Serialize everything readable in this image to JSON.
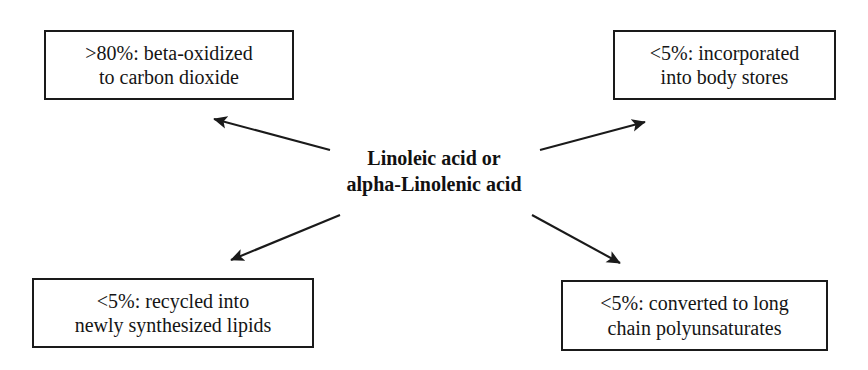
{
  "diagram": {
    "center": {
      "label": "Linoleic acid or\nalpha-Linolenic acid"
    },
    "nodes": {
      "top_left": {
        "label": ">80%: beta-oxidized\nto carbon dioxide",
        "percent": ">80%",
        "fate": "beta-oxidized to carbon dioxide"
      },
      "top_right": {
        "label": "<5%: incorporated\ninto body stores",
        "percent": "<5%",
        "fate": "incorporated into body stores"
      },
      "bottom_left": {
        "label": "<5%: recycled into\nnewly synthesized lipids",
        "percent": "<5%",
        "fate": "recycled into newly synthesized lipids"
      },
      "bottom_right": {
        "label": "<5%: converted to long\nchain polyunsaturates",
        "percent": "<5%",
        "fate": "converted to long chain polyunsaturates"
      }
    },
    "colors": {
      "background": "#ffffff",
      "border": "#1a1a1a",
      "text": "#151515",
      "arrow": "#1a1a1a"
    },
    "arrows": [
      {
        "name": "arrow-to-top-left",
        "from": [
          330,
          150
        ],
        "to": [
          211,
          117
        ]
      },
      {
        "name": "arrow-to-top-right",
        "from": [
          540,
          150
        ],
        "to": [
          648,
          120
        ]
      },
      {
        "name": "arrow-to-bottom-left",
        "from": [
          340,
          215
        ],
        "to": [
          228,
          262
        ]
      },
      {
        "name": "arrow-to-bottom-right",
        "from": [
          532,
          215
        ],
        "to": [
          623,
          266
        ]
      }
    ]
  }
}
